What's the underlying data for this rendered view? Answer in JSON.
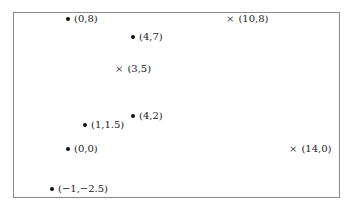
{
  "diagram": {
    "frame_color": "#8a8a8a",
    "points": [
      {
        "marker": "dot",
        "label": "(0,8)",
        "x": 66,
        "y": 13
      },
      {
        "marker": "dot",
        "label": "(4,7)",
        "x": 131,
        "y": 31
      },
      {
        "marker": "cross",
        "label": "(3,5)",
        "x": 115,
        "y": 63
      },
      {
        "marker": "cross",
        "label": "(10,8)",
        "x": 226,
        "y": 13
      },
      {
        "marker": "dot",
        "label": "(4,2)",
        "x": 131,
        "y": 110
      },
      {
        "marker": "dot",
        "label": "(1,1.5)",
        "x": 83,
        "y": 119
      },
      {
        "marker": "dot",
        "label": "(0,0)",
        "x": 66,
        "y": 143
      },
      {
        "marker": "cross",
        "label": "(14,0)",
        "x": 289,
        "y": 143
      },
      {
        "marker": "dot",
        "label": "(−1,−2.5)",
        "x": 50,
        "y": 183
      }
    ]
  }
}
